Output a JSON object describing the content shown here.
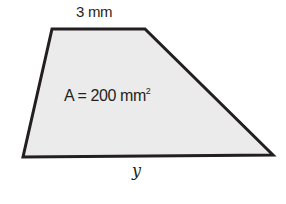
{
  "figure": {
    "shape": "trapezoid",
    "fill_color": "#ebebeb",
    "stroke_color": "#231f20",
    "vertices": [
      [
        52,
        29
      ],
      [
        145,
        29
      ],
      [
        273,
        155
      ],
      [
        23,
        157
      ]
    ],
    "top_side_label": "3 mm",
    "bottom_side_label": "y",
    "area_label_prefix": "A = 200 mm",
    "area_label_exponent": "2"
  }
}
